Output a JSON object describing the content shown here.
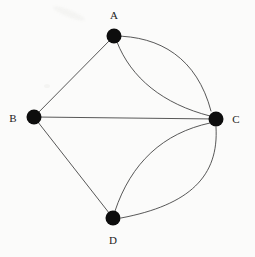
{
  "figure": {
    "type": "undirected-multigraph",
    "width": 255,
    "height": 257,
    "background_color": "#fbfbfa",
    "edge_color": "#3a3a3a",
    "vertex_color": "#0d0d0d",
    "label_color": "#1b1b1b",
    "vertex_radius": 7.5,
    "edge_count": 7,
    "vertex_count": 4
  },
  "vertices": [
    {
      "id": "A",
      "label": "A",
      "x": 114,
      "y": 36,
      "degree": 3,
      "label_x": 114,
      "label_y": 15
    },
    {
      "id": "B",
      "label": "B",
      "x": 34,
      "y": 117,
      "degree": 3,
      "label_x": 13,
      "label_y": 118
    },
    {
      "id": "C",
      "label": "C",
      "x": 216,
      "y": 119,
      "degree": 5,
      "label_x": 236,
      "label_y": 119
    },
    {
      "id": "D",
      "label": "D",
      "x": 113,
      "y": 218,
      "degree": 3,
      "label_x": 113,
      "label_y": 240
    }
  ],
  "edges": [
    {
      "id": "edge-a-b",
      "from": "A",
      "to": "B",
      "shape": "straight",
      "path": "M 114 36 L 34 117"
    },
    {
      "id": "edge-b-c",
      "from": "B",
      "to": "C",
      "shape": "straight",
      "path": "M 34 117 L 216 119"
    },
    {
      "id": "edge-b-d",
      "from": "B",
      "to": "D",
      "shape": "straight",
      "path": "M 34 117 L 113 218"
    },
    {
      "id": "edge-a-c-1",
      "from": "A",
      "to": "C",
      "shape": "curve-outer",
      "path": "M 114 36 C 160 36 197 58 211 111"
    },
    {
      "id": "edge-a-c-2",
      "from": "A",
      "to": "C",
      "shape": "curve-inner",
      "path": "M 117 42 C 131 78 163 104 210 116"
    },
    {
      "id": "edge-c-d-1",
      "from": "C",
      "to": "D",
      "shape": "curve-inner",
      "path": "M 210 123 C 163 133 131 163 115 211"
    },
    {
      "id": "edge-c-d-2",
      "from": "C",
      "to": "D",
      "shape": "curve-outer",
      "path": "M 216 127 C 219 176 190 205 121 218"
    }
  ]
}
